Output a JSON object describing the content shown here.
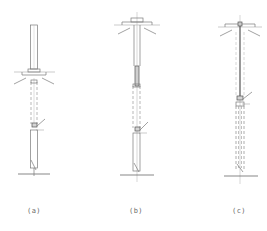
{
  "figure": {
    "panels": [
      {
        "id": "a",
        "label": "(a)",
        "center_x": 34,
        "description": "upright column above platform, dashed casing below, anchor bracket, base pile at ground"
      },
      {
        "id": "b",
        "label": "(b)",
        "center_x": 136,
        "description": "cap on top of platform, shaft extended through dashed casing to base pile at ground"
      },
      {
        "id": "c",
        "label": "(c)",
        "center_x": 239,
        "description": "thin rod through platform, long dashed casing down to ground"
      }
    ],
    "colors": {
      "line": "#7a7a7a",
      "dark_line": "#555555",
      "light_line": "#b5b5b5",
      "dash_line": "#9a9a9a",
      "background": "#ffffff"
    }
  }
}
